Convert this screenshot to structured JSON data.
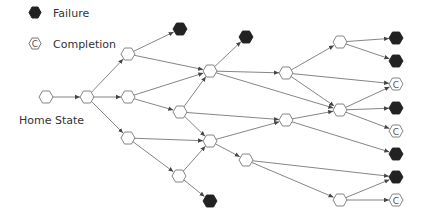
{
  "legend": {
    "failure_label": "Failure",
    "completion_label": "Completion",
    "completion_glyph": "C"
  },
  "home_label": "Home State",
  "colors": {
    "failure": "#222222",
    "stroke": "#777777",
    "edge": "#666666"
  },
  "nodes": [
    {
      "id": "home",
      "x": 46,
      "y": 97,
      "type": "state"
    },
    {
      "id": "a",
      "x": 87,
      "y": 97,
      "type": "state"
    },
    {
      "id": "b1",
      "x": 128,
      "y": 54,
      "type": "state"
    },
    {
      "id": "b2",
      "x": 128,
      "y": 97,
      "type": "state"
    },
    {
      "id": "b3",
      "x": 128,
      "y": 138,
      "type": "state"
    },
    {
      "id": "f1",
      "x": 180,
      "y": 29,
      "type": "failure"
    },
    {
      "id": "c1",
      "x": 210,
      "y": 71,
      "type": "state"
    },
    {
      "id": "c2",
      "x": 180,
      "y": 112,
      "type": "state"
    },
    {
      "id": "c3",
      "x": 210,
      "y": 141,
      "type": "state"
    },
    {
      "id": "c4",
      "x": 179,
      "y": 176,
      "type": "state"
    },
    {
      "id": "f2",
      "x": 246,
      "y": 37,
      "type": "failure"
    },
    {
      "id": "f3",
      "x": 210,
      "y": 201,
      "type": "failure"
    },
    {
      "id": "d1",
      "x": 286,
      "y": 73,
      "type": "state"
    },
    {
      "id": "d2",
      "x": 286,
      "y": 120,
      "type": "state"
    },
    {
      "id": "e",
      "x": 246,
      "y": 160,
      "type": "state"
    },
    {
      "id": "m1",
      "x": 340,
      "y": 42,
      "type": "state"
    },
    {
      "id": "m2",
      "x": 340,
      "y": 110,
      "type": "state"
    },
    {
      "id": "m3",
      "x": 340,
      "y": 200,
      "type": "state"
    },
    {
      "id": "r1",
      "x": 396,
      "y": 38,
      "type": "failure"
    },
    {
      "id": "r2",
      "x": 396,
      "y": 61,
      "type": "failure"
    },
    {
      "id": "r3",
      "x": 396,
      "y": 84,
      "type": "completion"
    },
    {
      "id": "r4",
      "x": 396,
      "y": 108,
      "type": "failure"
    },
    {
      "id": "r5",
      "x": 396,
      "y": 131,
      "type": "completion"
    },
    {
      "id": "r6",
      "x": 396,
      "y": 154,
      "type": "failure"
    },
    {
      "id": "r7",
      "x": 396,
      "y": 177,
      "type": "failure"
    },
    {
      "id": "r8",
      "x": 396,
      "y": 200,
      "type": "completion"
    }
  ],
  "edges": [
    [
      "home",
      "a"
    ],
    [
      "a",
      "b1"
    ],
    [
      "a",
      "b2"
    ],
    [
      "a",
      "b3"
    ],
    [
      "b1",
      "f1"
    ],
    [
      "b1",
      "c1"
    ],
    [
      "b2",
      "c1"
    ],
    [
      "b2",
      "c2"
    ],
    [
      "b3",
      "c3"
    ],
    [
      "b3",
      "c4"
    ],
    [
      "c2",
      "c1"
    ],
    [
      "c2",
      "d2"
    ],
    [
      "c2",
      "c3"
    ],
    [
      "c1",
      "f2"
    ],
    [
      "c1",
      "d1"
    ],
    [
      "c1",
      "m2"
    ],
    [
      "c3",
      "d2"
    ],
    [
      "c3",
      "e"
    ],
    [
      "c4",
      "c3"
    ],
    [
      "c4",
      "f3"
    ],
    [
      "d1",
      "m1"
    ],
    [
      "d1",
      "r3"
    ],
    [
      "d1",
      "m2"
    ],
    [
      "d2",
      "m2"
    ],
    [
      "d2",
      "r6"
    ],
    [
      "m1",
      "r1"
    ],
    [
      "m1",
      "r2"
    ],
    [
      "m2",
      "r3"
    ],
    [
      "m2",
      "r4"
    ],
    [
      "m2",
      "r5"
    ],
    [
      "e",
      "r7"
    ],
    [
      "e",
      "m3"
    ],
    [
      "m3",
      "r7"
    ],
    [
      "m3",
      "r8"
    ]
  ]
}
